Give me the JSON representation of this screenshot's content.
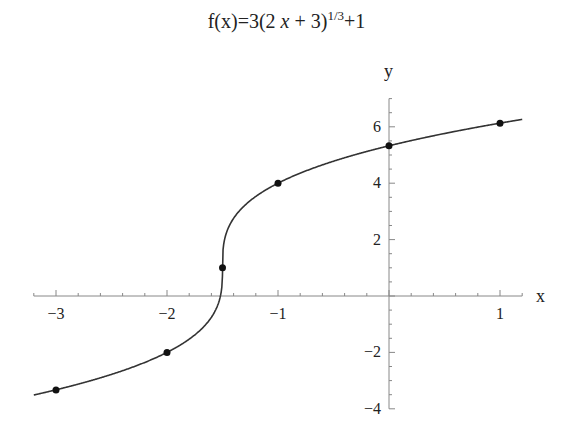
{
  "title": {
    "prefix": "f(x)=3(2 ",
    "var": "x",
    "mid": " + 3)",
    "exponent": "1/3",
    "suffix": "+1"
  },
  "axes": {
    "x_label": "x",
    "y_label": "y"
  },
  "chart_data": {
    "type": "line",
    "xlabel": "x",
    "ylabel": "y",
    "function": "3*cbrt(2*x+3)+1",
    "xlim": [
      -3.2,
      1.2
    ],
    "ylim": [
      -4,
      7
    ],
    "x_ticks": [
      -3,
      -2,
      -1,
      1
    ],
    "x_minor_step": 0.2,
    "y_ticks": [
      -4,
      -2,
      2,
      4,
      6
    ],
    "y_minor_step": 0.5,
    "grid": false,
    "legend": "none",
    "points": [
      {
        "x": -3,
        "y": -3.33
      },
      {
        "x": -2,
        "y": -2
      },
      {
        "x": -1.5,
        "y": 1
      },
      {
        "x": -1,
        "y": 4
      },
      {
        "x": 0,
        "y": 5.33
      },
      {
        "x": 1,
        "y": 6.13
      }
    ],
    "colors": {
      "curve": "#333333",
      "axis": "#888888",
      "points": "#111111"
    }
  }
}
